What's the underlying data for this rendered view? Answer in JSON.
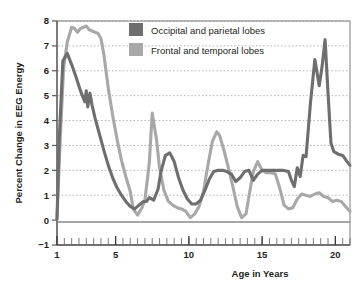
{
  "chart_data": {
    "type": "line",
    "title": "",
    "xlabel": "Age in Years",
    "ylabel": "Percent Change in EEG Energy",
    "xlim": [
      1,
      21
    ],
    "ylim": [
      -1,
      8
    ],
    "yticks": [
      "8",
      "7",
      "6",
      "5",
      "4",
      "3",
      "2",
      "1",
      "0",
      "−1"
    ],
    "ytick_values": [
      8,
      7,
      6,
      5,
      4,
      3,
      2,
      1,
      0,
      -1
    ],
    "xticks": [
      "1",
      "5",
      "10",
      "15",
      "20"
    ],
    "xtick_values": [
      1,
      5,
      10,
      15,
      20
    ],
    "minor_xtick_step": 0.5,
    "grid": "horizontal-dotted",
    "legend_position": "top-center-inside",
    "series": [
      {
        "name": "Occipital and parietal lobes",
        "color": "#6e6e6e",
        "x": [
          1.0,
          1.15,
          1.4,
          1.7,
          2.0,
          2.3,
          2.6,
          2.9,
          3.0,
          3.1,
          3.25,
          3.4,
          3.6,
          3.9,
          4.2,
          4.5,
          4.8,
          5.1,
          5.4,
          5.7,
          6.0,
          6.3,
          6.6,
          6.9,
          7.1,
          7.3,
          7.6,
          7.9,
          8.1,
          8.4,
          8.7,
          9.0,
          9.3,
          9.6,
          9.9,
          10.2,
          10.5,
          10.8,
          11.1,
          11.4,
          11.7,
          12.0,
          12.3,
          12.6,
          12.9,
          13.2,
          13.5,
          13.8,
          14.1,
          14.4,
          14.7,
          15.0,
          15.3,
          15.6,
          16.0,
          16.4,
          16.8,
          17.0,
          17.2,
          17.4,
          17.6,
          17.8,
          18.0,
          18.3,
          18.6,
          18.9,
          19.1,
          19.3,
          19.5,
          19.7,
          19.9,
          20.2,
          20.5,
          20.8,
          21.0
        ],
        "y": [
          0.05,
          3.2,
          6.4,
          6.7,
          6.25,
          5.75,
          5.2,
          4.75,
          5.2,
          4.55,
          5.1,
          4.6,
          4.1,
          3.45,
          2.8,
          2.2,
          1.7,
          1.3,
          1.0,
          0.75,
          0.55,
          0.45,
          0.6,
          0.75,
          0.75,
          0.9,
          0.8,
          1.25,
          1.95,
          2.6,
          2.7,
          2.35,
          1.7,
          1.2,
          0.85,
          0.65,
          0.65,
          0.8,
          1.2,
          1.65,
          1.95,
          2.0,
          2.0,
          1.95,
          1.85,
          1.55,
          1.7,
          1.95,
          2.0,
          1.6,
          1.85,
          2.0,
          2.0,
          2.0,
          2.0,
          2.0,
          1.95,
          1.6,
          1.35,
          2.1,
          1.75,
          2.6,
          2.55,
          4.7,
          6.45,
          5.4,
          6.2,
          7.25,
          5.1,
          3.1,
          2.75,
          2.65,
          2.6,
          2.35,
          2.2
        ]
      },
      {
        "name": "Frontal and temporal lobes",
        "color": "#a8a8a8",
        "x": [
          1.0,
          1.2,
          1.45,
          1.7,
          2.0,
          2.2,
          2.4,
          2.6,
          2.8,
          3.0,
          3.2,
          3.4,
          3.6,
          3.8,
          4.0,
          4.2,
          4.5,
          4.8,
          5.1,
          5.4,
          5.7,
          6.0,
          6.2,
          6.5,
          6.8,
          7.0,
          7.3,
          7.5,
          7.8,
          8.0,
          8.3,
          8.6,
          8.9,
          9.2,
          9.5,
          9.8,
          10.1,
          10.4,
          10.7,
          11.0,
          11.3,
          11.6,
          11.9,
          12.1,
          12.4,
          12.7,
          13.0,
          13.3,
          13.6,
          13.9,
          14.1,
          14.4,
          14.7,
          15.0,
          15.3,
          15.6,
          15.9,
          16.2,
          16.5,
          16.8,
          17.1,
          17.4,
          17.7,
          18.0,
          18.3,
          18.6,
          18.9,
          19.2,
          19.5,
          19.8,
          20.1,
          20.4,
          20.7,
          21.0
        ],
        "y": [
          0.05,
          3.0,
          6.1,
          7.15,
          7.75,
          7.7,
          7.55,
          7.7,
          7.75,
          7.8,
          7.65,
          7.6,
          7.55,
          7.5,
          7.3,
          6.65,
          5.3,
          4.2,
          3.25,
          2.4,
          1.75,
          1.15,
          0.45,
          0.2,
          0.5,
          0.8,
          2.3,
          4.3,
          3.2,
          2.1,
          1.2,
          0.75,
          0.6,
          0.5,
          0.45,
          0.35,
          0.1,
          0.25,
          0.55,
          1.15,
          2.2,
          3.15,
          3.55,
          3.4,
          2.8,
          2.1,
          1.35,
          0.55,
          0.1,
          0.25,
          0.95,
          1.95,
          2.35,
          2.0,
          1.9,
          1.9,
          1.85,
          1.3,
          0.6,
          0.45,
          0.5,
          0.85,
          1.05,
          1.0,
          0.95,
          1.05,
          1.1,
          0.95,
          0.9,
          0.75,
          0.8,
          0.75,
          0.55,
          0.35
        ]
      }
    ]
  },
  "legend": {
    "items": [
      {
        "label": "Occipital and parietal lobes",
        "color": "#6e6e6e"
      },
      {
        "label": "Frontal and temporal lobes",
        "color": "#a8a8a8"
      }
    ]
  },
  "axes": {
    "ylabel": "Percent Change in EEG Energy",
    "xlabel": "Age in Years"
  }
}
